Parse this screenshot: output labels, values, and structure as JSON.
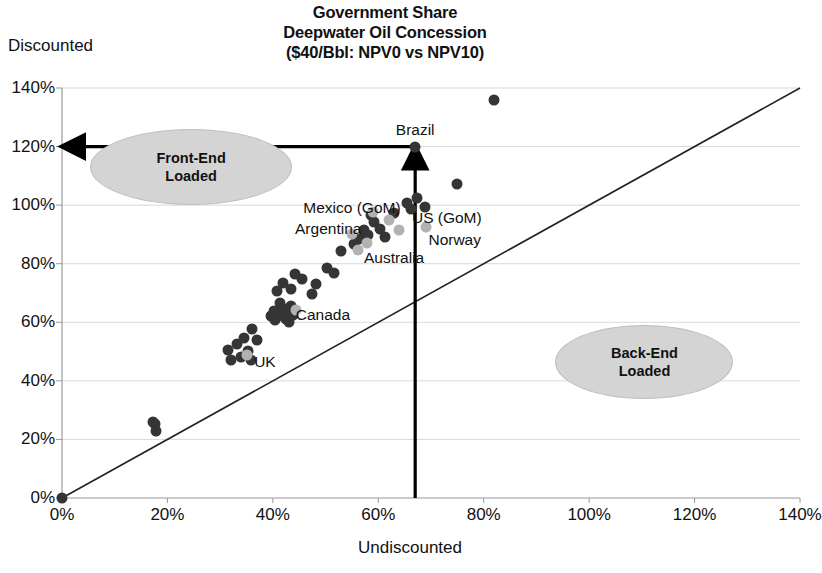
{
  "chart_data": {
    "type": "scatter",
    "title": "Government Share Deepwater Oil Concession ($40/Bbl: NPV0 vs NPV10)",
    "title_lines": [
      "Government Share",
      "Deepwater Oil Concession",
      "($40/Bbl: NPV0 vs NPV10)"
    ],
    "xlabel": "Undiscounted",
    "ylabel": "Discounted",
    "xlim": [
      0,
      140
    ],
    "ylim": [
      0,
      140
    ],
    "grid": true,
    "legend": "none",
    "x_ticks": [
      "0%",
      "20%",
      "40%",
      "60%",
      "80%",
      "100%",
      "120%",
      "140%"
    ],
    "y_ticks": [
      "0%",
      "20%",
      "40%",
      "60%",
      "80%",
      "100%",
      "120%",
      "140%"
    ],
    "x_tick_values": [
      0,
      20,
      40,
      60,
      80,
      100,
      120,
      140
    ],
    "y_tick_values": [
      0,
      20,
      40,
      60,
      80,
      100,
      120,
      140
    ],
    "colors": {
      "dark_marker": "#353535",
      "light_marker": "#b2b2b2",
      "grid": "#d9d9d9",
      "axis": "#9a9a9a",
      "annotation_line": "#000000",
      "ellipse_fill": "#d4d4d4",
      "ellipse_stroke": "#bdbdbd"
    },
    "reference_line": {
      "name": "parity-line",
      "from": [
        0,
        0
      ],
      "to": [
        140,
        140
      ],
      "note": "45-degree NPV0 = NPV10 parity line"
    },
    "series": [
      {
        "name": "dark-markers",
        "color": "#353535",
        "points": [
          [
            0,
            0
          ],
          [
            17.2,
            26.0
          ],
          [
            17.6,
            25.2
          ],
          [
            17.9,
            22.8
          ],
          [
            31.4,
            50.4
          ],
          [
            32.1,
            47.2
          ],
          [
            33.2,
            52.6
          ],
          [
            33.9,
            48.0
          ],
          [
            34.6,
            54.6
          ],
          [
            35.2,
            50.2
          ],
          [
            35.8,
            47.0
          ],
          [
            36.0,
            57.6
          ],
          [
            36.9,
            53.8
          ],
          [
            39.6,
            62.2
          ],
          [
            40.2,
            64.0
          ],
          [
            40.5,
            60.9
          ],
          [
            41.0,
            63.3
          ],
          [
            41.4,
            66.5
          ],
          [
            41.9,
            62.0
          ],
          [
            42.2,
            64.6
          ],
          [
            42.5,
            61.2
          ],
          [
            42.8,
            63.8
          ],
          [
            43.1,
            60.2
          ],
          [
            43.4,
            65.4
          ],
          [
            43.8,
            62.6
          ],
          [
            40.8,
            70.6
          ],
          [
            42.0,
            73.4
          ],
          [
            43.4,
            71.2
          ],
          [
            44.2,
            76.4
          ],
          [
            45.6,
            74.8
          ],
          [
            47.4,
            69.8
          ],
          [
            48.2,
            73.0
          ],
          [
            50.2,
            78.4
          ],
          [
            51.6,
            76.9
          ],
          [
            53.0,
            84.2
          ],
          [
            55.4,
            86.6
          ],
          [
            56.4,
            88.4
          ],
          [
            57.2,
            91.4
          ],
          [
            58.1,
            89.7
          ],
          [
            58.6,
            96.8
          ],
          [
            59.2,
            94.2
          ],
          [
            60.4,
            92.0
          ],
          [
            61.2,
            89.0
          ],
          [
            63.0,
            97.4
          ],
          [
            65.4,
            100.8
          ],
          [
            66.2,
            98.6
          ],
          [
            67.0,
            120.0
          ],
          [
            67.4,
            102.4
          ],
          [
            68.8,
            99.4
          ],
          [
            75.0,
            107.2
          ],
          [
            82.0,
            136.0
          ]
        ]
      },
      {
        "name": "light-markers",
        "color": "#b2b2b2",
        "points": [
          [
            35.0,
            49.0
          ],
          [
            44.4,
            64.2
          ],
          [
            55.0,
            90.2
          ],
          [
            56.2,
            84.8
          ],
          [
            57.8,
            87.0
          ],
          [
            59.0,
            97.6
          ],
          [
            62.0,
            95.0
          ],
          [
            64.0,
            91.4
          ],
          [
            69.0,
            92.6
          ]
        ]
      }
    ],
    "point_labels": [
      {
        "text": "Brazil",
        "x": 67.0,
        "y": 125.5,
        "anchor": "center"
      },
      {
        "text": "Mexico (GoM)",
        "x": 55.0,
        "y": 99.0,
        "anchor": "center"
      },
      {
        "text": "Argentina",
        "x": 50.5,
        "y": 92.0,
        "anchor": "center"
      },
      {
        "text": "US (GoM)",
        "x": 73.0,
        "y": 95.5,
        "anchor": "center"
      },
      {
        "text": "Norway",
        "x": 74.5,
        "y": 88.0,
        "anchor": "center"
      },
      {
        "text": "Australia",
        "x": 63.0,
        "y": 82.0,
        "anchor": "center"
      },
      {
        "text": "Canada",
        "x": 49.5,
        "y": 62.5,
        "anchor": "center"
      },
      {
        "text": "UK",
        "x": 38.5,
        "y": 46.5,
        "anchor": "center"
      }
    ],
    "annotations": [
      {
        "name": "front-end-loaded-callout",
        "label_lines": [
          "Front-End",
          "Loaded"
        ],
        "label": "Front-End Loaded",
        "x": 24.5,
        "y": 113.0
      },
      {
        "name": "back-end-loaded-callout",
        "label_lines": [
          "Back-End",
          "Loaded"
        ],
        "label": "Back-End Loaded",
        "x": 110.5,
        "y": 46.5
      }
    ],
    "arrows": [
      {
        "name": "vertical-arrow-to-brazil",
        "from": [
          67.0,
          0
        ],
        "to": [
          67.0,
          120.0
        ],
        "direction": "up"
      },
      {
        "name": "horizontal-arrow-to-axis",
        "from": [
          67.0,
          120.0
        ],
        "to": [
          0,
          120.0
        ],
        "direction": "left"
      }
    ]
  }
}
